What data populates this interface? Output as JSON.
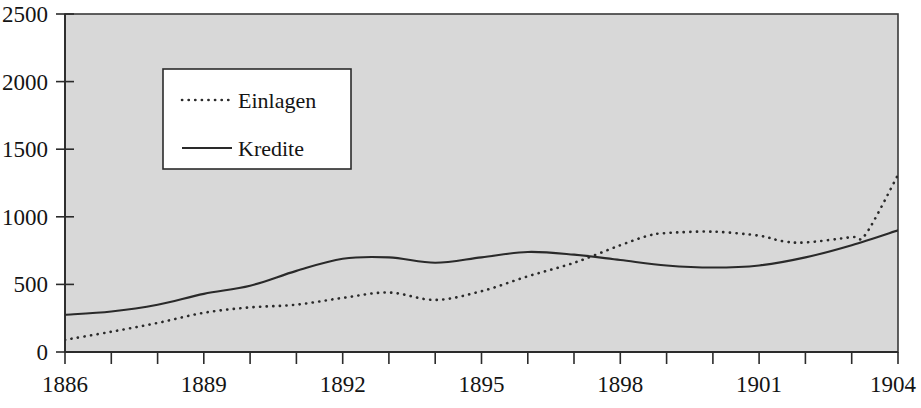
{
  "chart_data": {
    "type": "line",
    "title": "",
    "subtitle": "",
    "xlabel": "",
    "ylabel": "",
    "xlim": [
      1886,
      1904
    ],
    "ylim": [
      0,
      2500
    ],
    "grid": false,
    "legend_position": "upper-left-inside",
    "x": [
      1886,
      1887,
      1888,
      1889,
      1890,
      1891,
      1892,
      1893,
      1894,
      1895,
      1896,
      1897,
      1898,
      1899,
      1900,
      1901,
      1902,
      1903,
      1904
    ],
    "xticks": [
      1886,
      1887,
      1888,
      1889,
      1890,
      1891,
      1892,
      1893,
      1894,
      1895,
      1896,
      1897,
      1898,
      1899,
      1900,
      1901,
      1902,
      1903,
      1904
    ],
    "xtick_labels": [
      "1886",
      "",
      "",
      "1889",
      "",
      "",
      "1892",
      "",
      "",
      "1895",
      "",
      "",
      "1898",
      "",
      "",
      "1901",
      "",
      "",
      "1904"
    ],
    "xtick_labels_shown": [
      "1886",
      "1889",
      "1892",
      "1895",
      "1898",
      "1901",
      "1904"
    ],
    "yticks": [
      0,
      500,
      1000,
      1500,
      2000,
      2500
    ],
    "ytick_labels": [
      "0",
      "500",
      "1000",
      "1500",
      "2000",
      "2500"
    ],
    "series": [
      {
        "name": "Einlagen",
        "style": "dotted",
        "color": "#2a2a2a",
        "values": [
          90,
          150,
          215,
          290,
          330,
          350,
          400,
          440,
          385,
          450,
          560,
          670,
          800,
          880,
          890,
          870,
          815,
          820,
          860
        ]
      },
      {
        "name": "Kredite",
        "style": "solid",
        "color": "#2a2a2a",
        "values": [
          275,
          300,
          350,
          430,
          490,
          600,
          690,
          700,
          660,
          700,
          740,
          720,
          680,
          640,
          625,
          640,
          700,
          790,
          900
        ]
      }
    ],
    "series_full": [
      {
        "name": "Einlagen",
        "style": "dotted",
        "points": [
          [
            1886,
            90
          ],
          [
            1887,
            150
          ],
          [
            1888,
            215
          ],
          [
            1889,
            290
          ],
          [
            1890,
            330
          ],
          [
            1891,
            350
          ],
          [
            1892,
            400
          ],
          [
            1893,
            440
          ],
          [
            1894,
            385
          ],
          [
            1895,
            450
          ],
          [
            1896,
            560
          ],
          [
            1897,
            660
          ],
          [
            1898,
            790
          ],
          [
            1898.6,
            860
          ],
          [
            1899,
            880
          ],
          [
            1900,
            890
          ],
          [
            1901,
            860
          ],
          [
            1901.5,
            820
          ],
          [
            1902,
            810
          ],
          [
            1903,
            850
          ],
          [
            1903.3,
            870
          ],
          [
            1904,
            1310
          ]
        ]
      },
      {
        "name": "Kredite",
        "style": "solid",
        "points": [
          [
            1886,
            275
          ],
          [
            1887,
            300
          ],
          [
            1888,
            350
          ],
          [
            1889,
            430
          ],
          [
            1890,
            490
          ],
          [
            1891,
            600
          ],
          [
            1892,
            690
          ],
          [
            1893,
            700
          ],
          [
            1894,
            660
          ],
          [
            1895,
            700
          ],
          [
            1896,
            740
          ],
          [
            1897,
            720
          ],
          [
            1898,
            680
          ],
          [
            1899,
            640
          ],
          [
            1900,
            625
          ],
          [
            1901,
            640
          ],
          [
            1902,
            700
          ],
          [
            1903,
            790
          ],
          [
            1904,
            900
          ]
        ]
      }
    ],
    "annotations": [
      "Curves cross near 1895 where Einlagen overtakes Kredite briefly",
      "Kredite shows a local peak near 1899-1900 at about 1610 and a dip near 1901 at about 1480",
      "Einlagen plateaus near 890 from 1898 to 1900 then dips to about 810 around 1901-1902"
    ]
  },
  "legend": {
    "entries": [
      {
        "label": "Einlagen",
        "style": "dotted"
      },
      {
        "label": "Kredite",
        "style": "solid"
      }
    ]
  },
  "axes": {
    "y_labels": [
      "2500",
      "2000",
      "1500",
      "1000",
      "500",
      "0"
    ],
    "x_labels": [
      "1886",
      "1889",
      "1892",
      "1895",
      "1898",
      "1901",
      "1904"
    ]
  },
  "colors": {
    "plot_background": "#d8d8d8",
    "page_background": "#ffffff",
    "ink": "#2a2a2a",
    "border": "#3a3a3a"
  }
}
